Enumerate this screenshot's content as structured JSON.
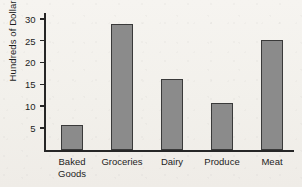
{
  "chart_data": {
    "type": "bar",
    "title": "",
    "xlabel": "",
    "ylabel": "Hundreds of Dollars",
    "categories": [
      "Baked\nGoods",
      "Groceries",
      "Dairy",
      "Produce",
      "Meat"
    ],
    "values": [
      5.8,
      29,
      16.3,
      10.8,
      25.4
    ],
    "yticks": [
      5,
      10,
      15,
      20,
      25,
      30
    ],
    "ylim": [
      0,
      31.5
    ],
    "grid": false,
    "legend": null,
    "colors": {
      "bar_fill": "#8b8b8b",
      "bar_edge": "#3a3a3a",
      "axis": "#262626",
      "text": "#1d1d1d",
      "background": "#f2f0eb"
    }
  }
}
